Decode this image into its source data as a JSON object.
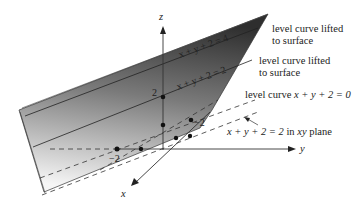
{
  "figure": {
    "type": "3d-surface-diagram",
    "surface": "plane z = x + y + 2 (shaded)",
    "axes": {
      "x_label": "x",
      "y_label": "y",
      "z_label": "z"
    },
    "ticks": {
      "z_tick": "2",
      "x_tick": "−2",
      "y_tick": "−2"
    },
    "surface_curves": [
      {
        "label": "x + y + 2 = 4"
      },
      {
        "label": "x + y + 2 = 2"
      }
    ],
    "annotations": {
      "lifted_1_line1": "level curve lifted",
      "lifted_1_line2": "to surface",
      "lifted_2_line1": "level curve lifted",
      "lifted_2_line2": "to surface",
      "level0_prefix": "level curve ",
      "level0_eq": "x + y + 2 = 0",
      "xy_plane_eq": "x + y + 2 = 2",
      "xy_plane_suffix": " in ",
      "xy_plane_word": "xy",
      "xy_plane_tail": " plane"
    },
    "colors": {
      "surface_dark": "#3a3a3a",
      "surface_light": "#f4f4f4",
      "line": "#222222"
    }
  }
}
